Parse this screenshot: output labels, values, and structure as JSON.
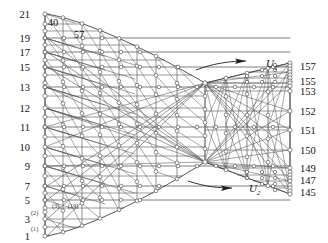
{
  "figure": {
    "type": "diagram",
    "background": "#ffffff",
    "line_color": "#4a4a4a",
    "node_fill": "#ffffff",
    "node_stroke": "#555555",
    "width": 328,
    "height": 243
  },
  "left_axis": {
    "name": "left-boundary-node-numbers",
    "labels": [
      {
        "text": "21",
        "x": 30,
        "y": 14
      },
      {
        "text": "19",
        "x": 30,
        "y": 38
      },
      {
        "text": "17",
        "x": 30,
        "y": 52
      },
      {
        "text": "15",
        "x": 30,
        "y": 67
      },
      {
        "text": "13",
        "x": 30,
        "y": 87
      },
      {
        "text": "12",
        "x": 30,
        "y": 108
      },
      {
        "text": "11",
        "x": 30,
        "y": 127
      },
      {
        "text": "10",
        "x": 30,
        "y": 147
      },
      {
        "text": "9",
        "x": 30,
        "y": 166
      },
      {
        "text": "7",
        "x": 30,
        "y": 186
      },
      {
        "text": "5",
        "x": 30,
        "y": 200
      },
      {
        "text": "3",
        "x": 30,
        "y": 219
      },
      {
        "text": "1",
        "x": 30,
        "y": 236
      }
    ]
  },
  "right_axis": {
    "name": "right-boundary-node-numbers",
    "labels": [
      {
        "text": "157",
        "x": 300,
        "y": 66
      },
      {
        "text": "155",
        "x": 300,
        "y": 81
      },
      {
        "text": "153",
        "x": 300,
        "y": 91
      },
      {
        "text": "152",
        "x": 300,
        "y": 111
      },
      {
        "text": "151",
        "x": 300,
        "y": 130
      },
      {
        "text": "150",
        "x": 300,
        "y": 150
      },
      {
        "text": "149",
        "x": 300,
        "y": 168
      },
      {
        "text": "147",
        "x": 300,
        "y": 180
      },
      {
        "text": "145",
        "x": 300,
        "y": 192
      }
    ]
  },
  "top_labels": [
    {
      "text": "40",
      "x": 53,
      "y": 22
    },
    {
      "text": "57",
      "x": 79,
      "y": 34
    }
  ],
  "element_labels": [
    {
      "text": "(2)",
      "x": 31,
      "y": 212
    },
    {
      "text": "(3)",
      "x": 52,
      "y": 205
    },
    {
      "text": "(19)",
      "x": 68,
      "y": 205
    },
    {
      "text": "(1)",
      "x": 31,
      "y": 228
    }
  ],
  "flow_annotations": [
    {
      "name": "flow-arrow-u1",
      "label": "U",
      "subscript": "1",
      "label_x": 266,
      "label_y": 67,
      "sub_x": 274,
      "sub_y": 70,
      "arrow_path": "M196,70 C214,63 232,61 246,61",
      "arrow_tip_x": 246,
      "arrow_tip_y": 61
    },
    {
      "name": "flow-arrow-u2",
      "label": "U",
      "subscript": "2",
      "label_x": 249,
      "label_y": 192,
      "sub_x": 257,
      "sub_y": 195,
      "arrow_path": "M188,181 C206,187 220,188 232,188",
      "arrow_tip_x": 232,
      "arrow_tip_y": 188
    }
  ],
  "geometry": {
    "left_x": 45,
    "right_x": 290,
    "waist_x": 205,
    "top_left_y": 14,
    "bottom_left_y": 236,
    "top_right_y": 63,
    "bottom_right_y": 194,
    "waist_top_y": 83,
    "waist_bottom_y": 162,
    "column_x": [
      45,
      63,
      82,
      100,
      119,
      137,
      156,
      177,
      205,
      226,
      247,
      268,
      290
    ],
    "major_row_names": [
      "21",
      "19",
      "17",
      "15",
      "13",
      "12",
      "11",
      "10",
      "9",
      "7",
      "5",
      "3",
      "1"
    ]
  }
}
